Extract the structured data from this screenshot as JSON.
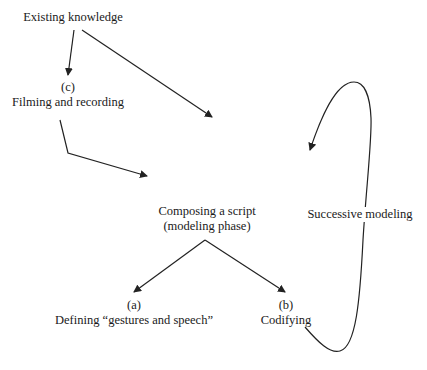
{
  "diagram": {
    "nodes": {
      "existing_knowledge": {
        "label": "Existing knowledge"
      },
      "filming": {
        "tag": "(c)",
        "label": "Filming and recording"
      },
      "composing": {
        "line1": "Composing a script",
        "line2": "(modeling phase)"
      },
      "defining": {
        "tag": "(a)",
        "label": "Defining “gestures and speech”"
      },
      "codifying": {
        "tag": "(b)",
        "label": "Codifying"
      },
      "successive": {
        "label": "Successive modeling"
      }
    },
    "edges": [
      {
        "from": "Existing knowledge",
        "to": "Filming and recording"
      },
      {
        "from": "Existing knowledge",
        "to": "Composing a script (modeling phase)"
      },
      {
        "from": "Filming and recording",
        "to": "Composing a script (modeling phase)"
      },
      {
        "from": "Composing a script (modeling phase)",
        "to": "Defining gestures and speech"
      },
      {
        "from": "Composing a script (modeling phase)",
        "to": "Codifying"
      },
      {
        "from": "Codifying",
        "to": "Composing a script (modeling phase)",
        "label": "Successive modeling"
      }
    ],
    "colors": {
      "stroke": "#222222",
      "text": "#1a1a1a",
      "background": "#ffffff"
    }
  }
}
